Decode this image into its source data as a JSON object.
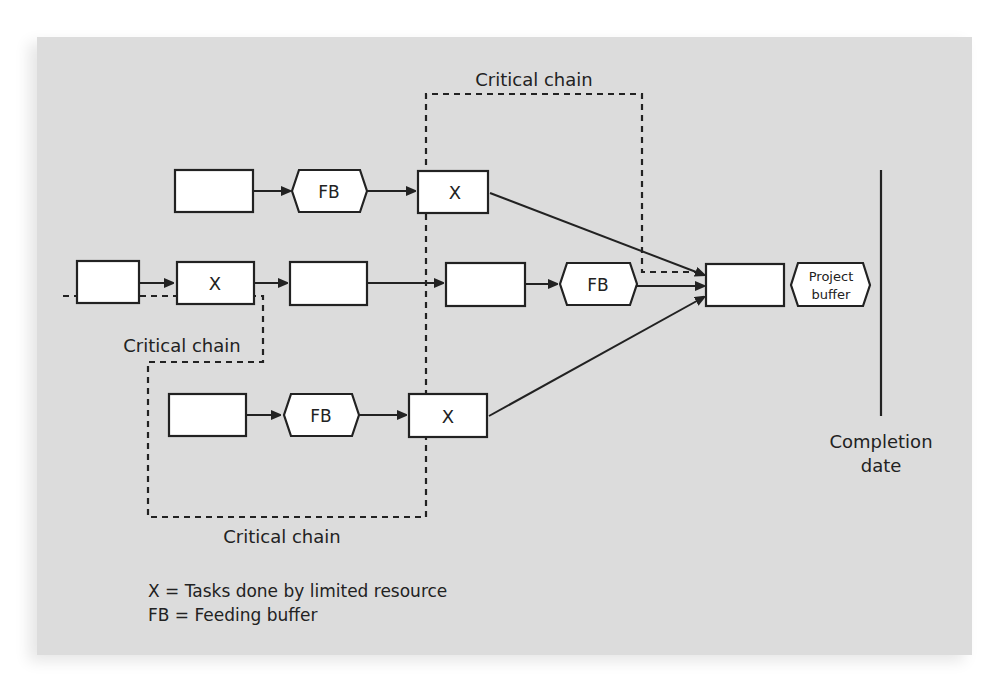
{
  "diagram": {
    "labels": {
      "critical_chain_top": "Critical chain",
      "critical_chain_left": "Critical chain",
      "critical_chain_bottom": "Critical chain",
      "completion_date_line1": "Completion",
      "completion_date_line2": "date",
      "project_buffer_line1": "Project",
      "project_buffer_line2": "buffer"
    },
    "nodes": {
      "top_task_1": "",
      "top_fb": "FB",
      "top_task_x": "X",
      "mid_task_1": "",
      "mid_task_x": "X",
      "mid_task_3": "",
      "mid_task_4": "",
      "mid_fb": "FB",
      "final_task": "",
      "bottom_task_1": "",
      "bottom_fb": "FB",
      "bottom_task_x": "X"
    },
    "legend": [
      "X = Tasks done by limited resource",
      "FB = Feeding buffer"
    ],
    "colors": {
      "background": "#dcdcdc",
      "box_fill": "#ffffff",
      "stroke": "#222222"
    }
  }
}
